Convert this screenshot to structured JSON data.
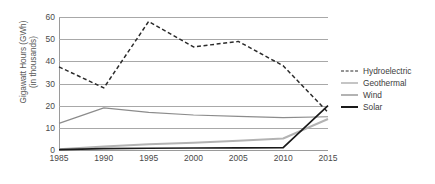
{
  "chart_data": {
    "type": "line",
    "title": "",
    "xlabel": "",
    "ylabel": "Gigawatt Hours (GWh)",
    "ylabel_line2": "(in thousands)",
    "x": [
      1985,
      1990,
      1995,
      2000,
      2005,
      2010,
      2015
    ],
    "categories": [
      "1985",
      "1990",
      "1995",
      "2000",
      "2005",
      "2010",
      "2015"
    ],
    "xlim": [
      1985,
      2015
    ],
    "ylim": [
      0,
      60
    ],
    "yticks": [
      0,
      10,
      20,
      30,
      40,
      50,
      60
    ],
    "ytick_labels": [
      "0",
      "10",
      "20",
      "30",
      "40",
      "50",
      "60"
    ],
    "grid": true,
    "legend_position": "right",
    "series": [
      {
        "name": "Hydroelectric",
        "style": "dashed",
        "color": "#2b2b2b",
        "values": [
          37.5,
          28.0,
          58.0,
          46.5,
          49.0,
          38.0,
          17.0
        ]
      },
      {
        "name": "Geothermal",
        "style": "solid",
        "color": "#8c8c8c",
        "values": [
          12.0,
          19.0,
          17.0,
          15.8,
          15.2,
          14.6,
          15.0
        ]
      },
      {
        "name": "Wind",
        "style": "solid",
        "color": "#b3b3b3",
        "values": [
          0.3,
          1.6,
          2.6,
          3.3,
          4.2,
          5.2,
          14.0
        ]
      },
      {
        "name": "Solar",
        "style": "solid",
        "color": "#1a1a1a",
        "values": [
          0.2,
          0.6,
          0.8,
          0.9,
          1.0,
          1.1,
          20.0
        ]
      }
    ]
  },
  "legend": {
    "items": [
      {
        "label": "Hydroelectric"
      },
      {
        "label": "Geothermal"
      },
      {
        "label": "Wind"
      },
      {
        "label": "Solar"
      }
    ]
  }
}
